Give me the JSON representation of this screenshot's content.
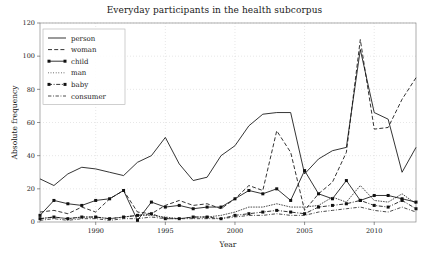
{
  "chart_data": {
    "type": "line",
    "title": "Everyday participants in the health subcorpus",
    "xlabel": "Year",
    "ylabel": "Absolute frequency",
    "xlim": [
      1986,
      2013
    ],
    "ylim": [
      0,
      120
    ],
    "xticks": [
      1990,
      1995,
      2000,
      2005,
      2010
    ],
    "yticks": [
      0,
      20,
      40,
      60,
      80,
      100,
      120
    ],
    "grid": true,
    "legend_position": "upper left",
    "x": [
      1986,
      1987,
      1988,
      1989,
      1990,
      1991,
      1992,
      1993,
      1994,
      1995,
      1996,
      1997,
      1998,
      1999,
      2000,
      2001,
      2002,
      2003,
      2004,
      2005,
      2006,
      2007,
      2008,
      2009,
      2010,
      2011,
      2012,
      2013
    ],
    "series": [
      {
        "name": "person",
        "style": "solid",
        "marker": "none",
        "values": [
          26,
          22,
          29,
          33,
          32,
          30,
          28,
          36,
          40,
          51,
          35,
          25,
          27,
          40,
          46,
          58,
          65,
          66,
          66,
          29,
          38,
          43,
          45,
          104,
          66,
          62,
          30,
          45
        ]
      },
      {
        "name": "woman",
        "style": "dashed",
        "marker": "none",
        "values": [
          6,
          7,
          5,
          9,
          6,
          14,
          19,
          6,
          5,
          10,
          13,
          10,
          11,
          8,
          14,
          22,
          19,
          55,
          42,
          7,
          17,
          24,
          42,
          110,
          56,
          57,
          74,
          87
        ]
      },
      {
        "name": "child",
        "style": "solid",
        "marker": "square",
        "values": [
          4,
          13,
          11,
          10,
          13,
          14,
          19,
          1,
          12,
          9,
          10,
          8,
          9,
          9,
          14,
          19,
          17,
          20,
          13,
          31,
          17,
          14,
          25,
          13,
          16,
          16,
          14,
          12
        ]
      },
      {
        "name": "man",
        "style": "dotted",
        "marker": "none",
        "values": [
          2,
          3,
          2,
          3,
          3,
          2,
          3,
          4,
          4,
          3,
          2,
          3,
          3,
          4,
          6,
          9,
          9,
          11,
          9,
          9,
          10,
          15,
          12,
          22,
          13,
          12,
          17,
          11
        ]
      },
      {
        "name": "baby",
        "style": "dashdot",
        "marker": "square",
        "values": [
          2,
          3,
          2,
          3,
          3,
          2,
          3,
          4,
          5,
          2,
          2,
          3,
          3,
          2,
          4,
          5,
          6,
          7,
          6,
          5,
          9,
          10,
          11,
          13,
          10,
          9,
          13,
          8
        ]
      },
      {
        "name": "consumer",
        "style": "dashdot-thin",
        "marker": "none",
        "values": [
          1,
          2,
          1,
          2,
          2,
          1,
          2,
          2,
          3,
          2,
          2,
          2,
          2,
          2,
          3,
          4,
          4,
          5,
          4,
          4,
          6,
          7,
          8,
          9,
          7,
          6,
          9,
          6
        ]
      }
    ]
  },
  "legend": {
    "items": [
      {
        "label": "person"
      },
      {
        "label": "woman"
      },
      {
        "label": "child"
      },
      {
        "label": "man"
      },
      {
        "label": "baby"
      },
      {
        "label": "consumer"
      }
    ]
  },
  "colors": {
    "line": "#111111",
    "grid": "#cfcfcf",
    "frame": "#8a8a8a",
    "background": "#ffffff"
  }
}
